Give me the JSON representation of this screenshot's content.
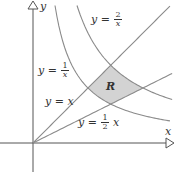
{
  "diagram": {
    "axes": {
      "x_label": "x",
      "y_label": "y",
      "origin_px": [
        33,
        143
      ],
      "scale_px_per_unit": 55,
      "x_range": [
        -0.6,
        2.5
      ],
      "y_range": [
        -0.5,
        2.55
      ]
    },
    "curves": [
      {
        "id": "y-eq-1-over-x",
        "type": "reciprocal",
        "k": 1,
        "x_from": 0.4,
        "x_to": 2.49
      },
      {
        "id": "y-eq-2-over-x",
        "type": "reciprocal",
        "k": 2,
        "x_from": 0.8,
        "x_to": 2.53
      },
      {
        "id": "y-eq-x",
        "type": "linear",
        "m": 1,
        "x_from": 0,
        "x_to": 2.49
      },
      {
        "id": "y-eq-half-x",
        "type": "linear",
        "m": 0.5,
        "x_from": 0,
        "x_to": 2.53
      }
    ],
    "labels": {
      "two_over_x": {
        "lhs": "y",
        "eq": "=",
        "num": "2",
        "den": "x"
      },
      "one_over_x": {
        "lhs": "y",
        "eq": "=",
        "num": "1",
        "den": "x"
      },
      "y_eq_x": {
        "lhs": "y",
        "eq": "=",
        "rhs": "x"
      },
      "half_x": {
        "lhs": "y",
        "eq": "=",
        "num": "1",
        "den": "2",
        "rhs": "x"
      },
      "region": "R"
    },
    "colors": {
      "axis": "#555555",
      "curve": "#8a8a8a",
      "region_fill": "#d3d3d3"
    }
  }
}
